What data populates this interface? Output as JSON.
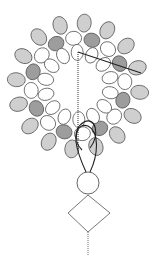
{
  "diagram": {
    "type": "beadwork-pattern",
    "colors": {
      "background": "#ffffff",
      "bead_white": "#ffffff",
      "bead_light": "#cfcfcf",
      "bead_dark": "#9d9d9d",
      "outline": "#5a5a5a",
      "thread": "#2a2a2a"
    },
    "ring": {
      "center": [
        78,
        86
      ],
      "outer_radius": 62,
      "middle_radius": 47,
      "inner_radius": 33
    },
    "round_bead": {
      "cx": 88,
      "cy": 183,
      "r": 11
    },
    "diamond_bead": {
      "top": [
        88,
        195
      ],
      "right": [
        110,
        213
      ],
      "bottom": [
        88,
        232
      ],
      "left": [
        68,
        213
      ]
    },
    "thread_tail": {
      "x": 88,
      "y1": 232,
      "y2": 256
    }
  }
}
